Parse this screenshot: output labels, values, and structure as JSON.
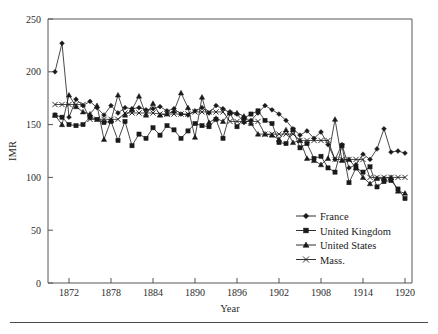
{
  "figure": {
    "y_axis_title": "IMR",
    "x_axis_title": "Year",
    "footer_rule": "horizontal-rule"
  },
  "legend": {
    "position": "bottom-right-inside",
    "entries": [
      {
        "label": "France",
        "marker": "diamond"
      },
      {
        "label": "United Kingdom",
        "marker": "square"
      },
      {
        "label": "United States",
        "marker": "triangle"
      },
      {
        "label": "Mass.",
        "marker": "x"
      }
    ]
  },
  "chart_data": {
    "type": "line",
    "title": "",
    "xlabel": "Year",
    "ylabel": "IMR",
    "xlim": [
      1869,
      1921
    ],
    "ylim": [
      0,
      250
    ],
    "ytick_labels": [
      "0",
      "50",
      "100",
      "150",
      "200",
      "250"
    ],
    "yticks": [
      0,
      50,
      100,
      150,
      200,
      250
    ],
    "xtick_labels": [
      "1872",
      "1878",
      "1884",
      "1890",
      "1896",
      "1902",
      "1908",
      "1914",
      "1920"
    ],
    "xticks": [
      1872,
      1878,
      1884,
      1890,
      1896,
      1902,
      1908,
      1914,
      1920
    ],
    "grid": false,
    "x": [
      1870,
      1871,
      1872,
      1873,
      1874,
      1875,
      1876,
      1877,
      1878,
      1879,
      1880,
      1881,
      1882,
      1883,
      1884,
      1885,
      1886,
      1887,
      1888,
      1889,
      1890,
      1891,
      1892,
      1893,
      1894,
      1895,
      1896,
      1897,
      1898,
      1899,
      1900,
      1901,
      1902,
      1903,
      1904,
      1905,
      1906,
      1907,
      1908,
      1909,
      1910,
      1911,
      1912,
      1913,
      1914,
      1915,
      1916,
      1917,
      1918,
      1919,
      1920
    ],
    "series": [
      {
        "name": "France",
        "marker": "diamond",
        "values": [
          200,
          227,
          157,
          174,
          168,
          172,
          166,
          159,
          168,
          161,
          166,
          165,
          166,
          164,
          165,
          167,
          163,
          165,
          160,
          159,
          163,
          166,
          161,
          168,
          165,
          161,
          160,
          152,
          154,
          161,
          168,
          164,
          160,
          154,
          146,
          140,
          144,
          137,
          143,
          131,
          117,
          131,
          109,
          112,
          122,
          117,
          127,
          146,
          124,
          125,
          123
        ]
      },
      {
        "name": "United Kingdom",
        "marker": "square",
        "values": [
          159,
          157,
          150,
          149,
          150,
          157,
          155,
          152,
          153,
          135,
          153,
          130,
          141,
          137,
          147,
          140,
          149,
          145,
          137,
          144,
          151,
          149,
          148,
          155,
          137,
          161,
          148,
          156,
          160,
          163,
          154,
          151,
          133,
          132,
          145,
          128,
          132,
          118,
          120,
          109,
          105,
          130,
          95,
          109,
          105,
          110,
          91,
          96,
          97,
          89,
          80
        ]
      },
      {
        "name": "United States",
        "marker": "triangle",
        "values": [
          159,
          150,
          178,
          167,
          162,
          160,
          168,
          136,
          154,
          178,
          159,
          164,
          177,
          159,
          170,
          159,
          160,
          163,
          180,
          166,
          138,
          176,
          152,
          156,
          153,
          162,
          161,
          158,
          151,
          141,
          141,
          140,
          136,
          145,
          133,
          135,
          118,
          116,
          112,
          118,
          155,
          116,
          117,
          109,
          100,
          94,
          99,
          99,
          100,
          87,
          85
        ]
      },
      {
        "name": "Mass.",
        "marker": "x",
        "values": [
          169,
          169,
          169,
          169,
          169,
          155,
          155,
          155,
          155,
          155,
          161,
          161,
          161,
          161,
          161,
          160,
          160,
          160,
          160,
          160,
          162,
          162,
          162,
          162,
          162,
          153,
          153,
          153,
          153,
          153,
          141,
          141,
          141,
          141,
          141,
          135,
          135,
          135,
          135,
          135,
          117,
          117,
          117,
          117,
          117,
          100,
          100,
          100,
          100,
          100,
          100
        ]
      }
    ]
  }
}
